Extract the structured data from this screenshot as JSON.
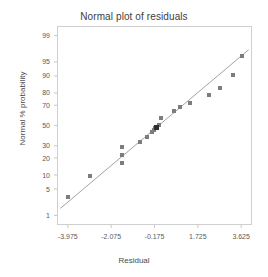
{
  "chart_data": {
    "type": "scatter",
    "title": "Normal plot of residuals",
    "xlabel": "Residual",
    "ylabel": "Normal % probability",
    "grid": false,
    "legend": null,
    "xlim": [
      -4.45,
      4.1
    ],
    "ylim_probability": [
      0.5,
      99.5
    ],
    "x_tick_labels": [
      "-3.975",
      "-2.075",
      "-0.175",
      "1.725",
      "3.625"
    ],
    "x_tick_values": [
      -3.975,
      -2.075,
      -0.175,
      1.725,
      3.625
    ],
    "y_tick_labels": [
      "99",
      "95",
      "90",
      "80",
      "70",
      "50",
      "30",
      "20",
      "10",
      "5",
      "1"
    ],
    "y_tick_values": [
      99,
      95,
      90,
      80,
      70,
      50,
      30,
      20,
      10,
      5,
      1
    ],
    "reference_line": {
      "x_start": -4.3,
      "y_start_probability": 1.6,
      "x_end": 3.95,
      "y_end_probability": 97.5
    },
    "points": [
      {
        "x": -3.95,
        "p": 3.3
      },
      {
        "x": -3.02,
        "p": 9.6
      },
      {
        "x": -1.62,
        "p": 28.5
      },
      {
        "x": -1.62,
        "p": 22.5
      },
      {
        "x": -1.6,
        "p": 16.5
      },
      {
        "x": -0.82,
        "p": 33.0
      },
      {
        "x": -0.52,
        "p": 38.5
      },
      {
        "x": -0.3,
        "p": 43.5
      },
      {
        "x": -0.2,
        "p": 45.5
      },
      {
        "x": -0.15,
        "p": 47.0
      },
      {
        "x": 0.03,
        "p": 51.0
      },
      {
        "x": 0.12,
        "p": 58.0
      },
      {
        "x": 0.7,
        "p": 65.0
      },
      {
        "x": 0.95,
        "p": 68.0
      },
      {
        "x": 1.4,
        "p": 72.0
      },
      {
        "x": 2.22,
        "p": 78.5
      },
      {
        "x": 2.68,
        "p": 83.5
      },
      {
        "x": 3.28,
        "p": 90.5
      },
      {
        "x": 3.64,
        "p": 96.5
      }
    ],
    "highlighted_point": {
      "x": -0.1,
      "p": 48.0
    }
  },
  "axes": {
    "title": "Normal plot of residuals",
    "x_title": "Residual",
    "y_title": "Normal % probability"
  }
}
